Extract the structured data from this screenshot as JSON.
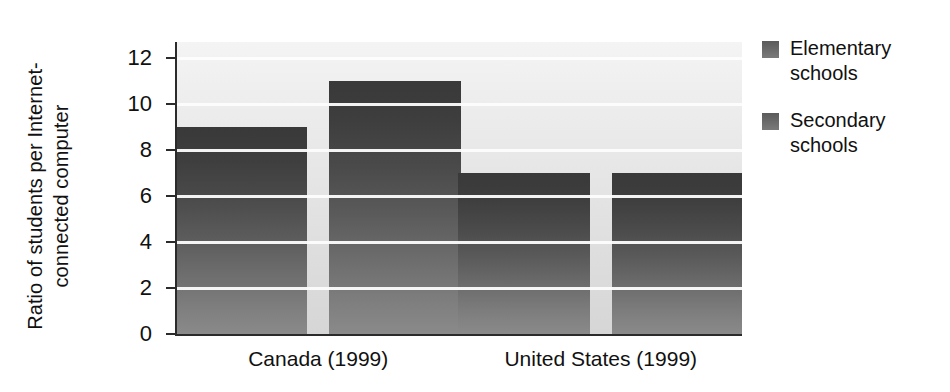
{
  "chart_data": {
    "type": "bar",
    "title": "",
    "subtitle": "",
    "xlabel": "",
    "ylabel_lines": [
      "Ratio of students per Internet-",
      "connected computer"
    ],
    "ylabel": "Ratio of students per Internet-connected computer",
    "categories": [
      "Canada (1999)",
      "United States (1999)"
    ],
    "series": [
      {
        "name": "Elementary schools",
        "name_lines": [
          "Elementary",
          "schools"
        ],
        "values": [
          9,
          7
        ]
      },
      {
        "name": "Secondary schools",
        "name_lines": [
          "Secondary",
          "schools"
        ],
        "values": [
          11,
          7
        ]
      }
    ],
    "bars": [
      {
        "group": "Canada (1999)",
        "series": "Elementary schools",
        "value": 9
      },
      {
        "group": "Canada (1999)",
        "series": "Secondary schools",
        "value": 7
      },
      {
        "group": "United States (1999)",
        "series": "Elementary schools",
        "value": 11
      },
      {
        "group": "United States (1999)",
        "series": "Secondary schools",
        "value": 7
      }
    ],
    "yticks": [
      0,
      2,
      4,
      6,
      8,
      10,
      12
    ],
    "ytick_labels": [
      "0",
      "2",
      "4",
      "6",
      "8",
      "10",
      "12"
    ],
    "ylim": [
      0,
      12.7
    ],
    "grid": "horizontal",
    "legend_position": "right",
    "colors": {
      "bar_top": "#393939",
      "bar_bottom": "#8a8a8a",
      "plot_background_top": "#f4f4f4",
      "plot_background_bottom": "#d6d6d6",
      "gridline": "#fdfdfd",
      "axis": "#2b2b2b",
      "text": "#111111"
    }
  }
}
